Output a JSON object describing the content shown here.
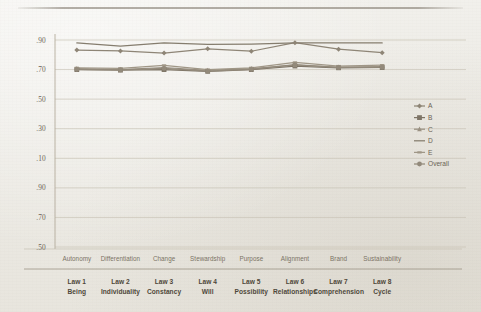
{
  "figure": {
    "background_color": "#eceae4",
    "ink_color": "#6d6557"
  },
  "axis": {
    "y_tick_labels": [
      ".90",
      ".70",
      ".50",
      ".30",
      ".10",
      ".90",
      ".70",
      ".50"
    ],
    "x_category_labels": [
      "Autonomy",
      "Differentiation",
      "Change",
      "Stewardship",
      "Purpose",
      "Alignment",
      "Brand",
      "Sustainability"
    ],
    "x_law_numbers": [
      "Law 1",
      "Law 2",
      "Law 3",
      "Law 4",
      "Law 5",
      "Law 6",
      "Law 7",
      "Law 8"
    ],
    "x_law_names": [
      "Being",
      "Individuality",
      "Constancy",
      "Will",
      "Possibility",
      "Relationships",
      "Comprehension",
      "Cycle"
    ]
  },
  "legend": {
    "position": "right",
    "entries": [
      {
        "label": "A",
        "marker": "diamond",
        "color": "#8e8576"
      },
      {
        "label": "B",
        "marker": "square",
        "color": "#7d7466"
      },
      {
        "label": "C",
        "marker": "triangle",
        "color": "#9a9182"
      },
      {
        "label": "D",
        "marker": "line",
        "color": "#857d6e"
      },
      {
        "label": "E",
        "marker": "dash",
        "color": "#a09787"
      },
      {
        "label": "Overall",
        "marker": "circle",
        "color": "#938a7b"
      }
    ]
  },
  "chart_data": {
    "type": "line",
    "title": "",
    "xlabel": "",
    "ylabel": "",
    "grid": true,
    "legend_position": "right",
    "categories": [
      "Autonomy",
      "Differentiation",
      "Change",
      "Stewardship",
      "Purpose",
      "Alignment",
      "Brand",
      "Sustainability"
    ],
    "tick_positions": [
      0.9,
      0.7,
      0.5,
      0.3,
      0.1,
      0.9,
      0.7,
      0.5
    ],
    "axis_note": "Y tick labels repeat (.90,.70,.50,.30,.10,.90,.70,.50) as printed on the scanned page; gridlines are evenly spaced. Series values below are expressed as normalized plot positions from the top gridline (index 0 = .90 top) to the bottom gridline.",
    "ylim": [
      0,
      7
    ],
    "series": [
      {
        "name": "A",
        "color": "#8e8576",
        "marker": "diamond",
        "values": [
          0.34,
          0.37,
          0.44,
          0.3,
          0.38,
          0.09,
          0.31,
          0.43
        ]
      },
      {
        "name": "B",
        "color": "#7d7466",
        "marker": "square",
        "values": [
          1.0,
          1.02,
          1.0,
          1.06,
          1.0,
          0.88,
          0.94,
          0.93
        ]
      },
      {
        "name": "C",
        "color": "#9a9182",
        "marker": "triangle",
        "values": [
          0.97,
          1.0,
          0.93,
          1.03,
          0.97,
          0.85,
          0.92,
          0.9
        ]
      },
      {
        "name": "D",
        "color": "#857d6e",
        "marker": "line",
        "values": [
          0.1,
          0.21,
          0.1,
          0.15,
          0.14,
          0.1,
          0.1,
          0.1
        ]
      },
      {
        "name": "E",
        "color": "#a09787",
        "marker": "dash",
        "values": [
          0.94,
          0.96,
          0.86,
          1.0,
          0.94,
          0.76,
          0.88,
          0.85
        ]
      },
      {
        "name": "Overall",
        "color": "#938a7b",
        "marker": "circle",
        "values": [
          0.99,
          1.01,
          0.96,
          1.05,
          0.99,
          0.83,
          0.93,
          0.92
        ]
      }
    ]
  }
}
